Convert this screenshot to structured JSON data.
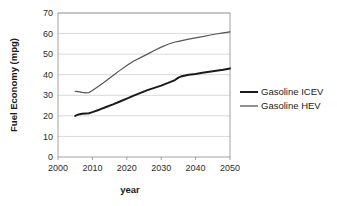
{
  "chart_data": {
    "type": "line",
    "title": "",
    "xlabel": "year",
    "ylabel": "Fuel Economy (mpg)",
    "xlim": [
      2000,
      2050
    ],
    "ylim": [
      0,
      70
    ],
    "xticks": [
      2000,
      2010,
      2020,
      2030,
      2040,
      2050
    ],
    "yticks": [
      0,
      10,
      20,
      30,
      40,
      50,
      60,
      70
    ],
    "grid": "horizontal",
    "legend_position": "right",
    "x": [
      2005,
      2006,
      2007,
      2008,
      2009,
      2010,
      2012,
      2014,
      2016,
      2018,
      2020,
      2022,
      2024,
      2026,
      2028,
      2030,
      2032,
      2034,
      2035,
      2036,
      2038,
      2040,
      2042,
      2044,
      2046,
      2048,
      2050
    ],
    "series": [
      {
        "name": "Gasoline ICEV",
        "color": "#1a1a1a",
        "width": 2.0,
        "values": [
          20.0,
          20.7,
          21.0,
          21.2,
          21.3,
          21.8,
          23.0,
          24.3,
          25.6,
          27.0,
          28.4,
          29.8,
          31.2,
          32.5,
          33.6,
          34.7,
          36.0,
          37.4,
          38.6,
          39.3,
          40.0,
          40.4,
          40.9,
          41.4,
          41.9,
          42.4,
          43.0
        ]
      },
      {
        "name": "Gasoline HEV",
        "color": "#555555",
        "width": 1.2,
        "values": [
          31.9,
          31.8,
          31.4,
          31.2,
          31.3,
          32.3,
          34.6,
          37.1,
          39.6,
          42.1,
          44.5,
          46.7,
          48.3,
          50.0,
          51.8,
          53.4,
          54.8,
          55.9,
          56.2,
          56.6,
          57.3,
          57.9,
          58.5,
          59.2,
          59.8,
          60.3,
          60.8
        ]
      }
    ]
  },
  "legend": {
    "items": [
      {
        "label": "Gasoline ICEV"
      },
      {
        "label": "Gasoline HEV"
      }
    ]
  },
  "axes": {
    "x_title": "year",
    "y_title": "Fuel Economy (mpg)",
    "x_tick_labels": [
      "2000",
      "2010",
      "2020",
      "2030",
      "2040",
      "2050"
    ],
    "y_tick_labels": [
      "0",
      "10",
      "20",
      "30",
      "40",
      "50",
      "60",
      "70"
    ]
  }
}
